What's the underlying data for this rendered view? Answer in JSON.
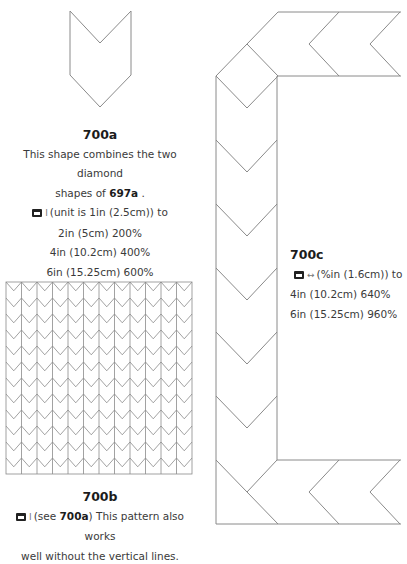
{
  "shape_700a": {
    "title": "700a",
    "line1": "This shape combines the two diamond",
    "line2_prefix": "shapes of ",
    "line2_ref": "697a",
    "line2_suffix": " .",
    "icon": "printer-icon",
    "symbol": "I",
    "line3": "(unit is 1in (2.5cm)) to",
    "sizes": [
      "2in (5cm) 200%",
      "4in (10.2cm) 400%",
      "6in (15.25cm) 600%"
    ]
  },
  "shape_700b": {
    "title": "700b",
    "icon": "printer-icon",
    "symbol": "I",
    "line1_prefix": "(see ",
    "line1_ref": "700a",
    "line1_suffix": ") This pattern also works",
    "line2": "well without the vertical lines.",
    "grid": {
      "columns": 12,
      "rows": 12
    }
  },
  "shape_700c": {
    "title": "700c",
    "icon": "printer-icon",
    "symbol": "↔",
    "line1": "(%in (1.6cm)) to",
    "sizes": [
      "4in (10.2cm) 640%",
      "6in (15.25cm) 960%"
    ]
  },
  "colors": {
    "line": "#8a8a8a",
    "text": "#3a3a3a"
  }
}
